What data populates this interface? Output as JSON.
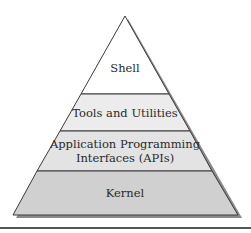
{
  "diagram": {
    "type": "pyramid",
    "layers": [
      {
        "label_lines": [
          "Shell"
        ],
        "fill": "#ffffff"
      },
      {
        "label_lines": [
          "Tools and Utilities"
        ],
        "fill": "#ececec"
      },
      {
        "label_lines": [
          "Application Programming",
          "Interfaces (APIs)"
        ],
        "fill": "#e3e3e3"
      },
      {
        "label_lines": [
          "Kernel"
        ],
        "fill": "#d0d0d0"
      }
    ],
    "colors": {
      "outline": "#3a3a3a",
      "shadow": "#8a8a8a",
      "rule": "#555555"
    }
  }
}
